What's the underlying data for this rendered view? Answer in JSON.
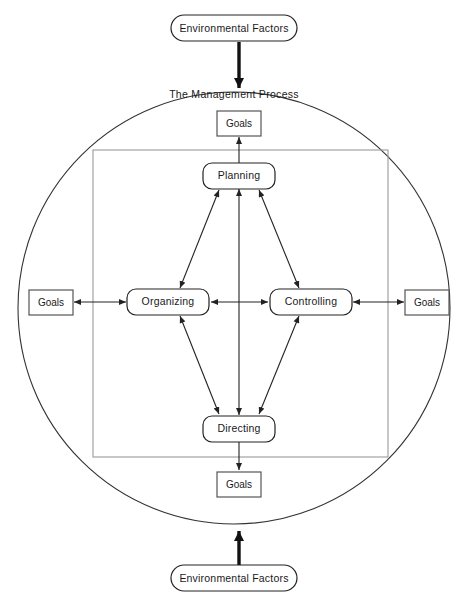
{
  "diagram": {
    "title": "The Management Process",
    "external_nodes": [
      {
        "id": "env-top",
        "label": "Environmental Factors",
        "shape": "rounded",
        "x": 234,
        "y": 28,
        "w": 126,
        "h": 26
      },
      {
        "id": "env-bottom",
        "label": "Environmental Factors",
        "shape": "rounded",
        "x": 234,
        "y": 578,
        "w": 126,
        "h": 26
      }
    ],
    "goal_nodes": [
      {
        "id": "goals-top",
        "label": "Goals",
        "shape": "rect",
        "x": 239,
        "y": 123,
        "w": 44,
        "h": 25
      },
      {
        "id": "goals-left",
        "label": "Goals",
        "shape": "rect",
        "x": 51,
        "y": 302,
        "w": 44,
        "h": 25
      },
      {
        "id": "goals-right",
        "label": "Goals",
        "shape": "rect",
        "x": 427,
        "y": 302,
        "w": 44,
        "h": 25
      },
      {
        "id": "goals-bottom",
        "label": "Goals",
        "shape": "rect",
        "x": 239,
        "y": 484,
        "w": 44,
        "h": 25
      }
    ],
    "process_nodes": [
      {
        "id": "planning",
        "label": "Planning",
        "shape": "rounded",
        "x": 239,
        "y": 175,
        "w": 72,
        "h": 25
      },
      {
        "id": "organizing",
        "label": "Organizing",
        "shape": "rounded",
        "x": 168,
        "y": 302,
        "w": 82,
        "h": 25
      },
      {
        "id": "controlling",
        "label": "Controlling",
        "shape": "rounded",
        "x": 311,
        "y": 302,
        "w": 82,
        "h": 25
      },
      {
        "id": "directing",
        "label": "Directing",
        "shape": "rounded",
        "x": 239,
        "y": 429,
        "w": 72,
        "h": 25
      }
    ],
    "boundary": {
      "circle": {
        "cx": 234,
        "cy": 308,
        "r": 216
      },
      "inner_rect": {
        "x": 93,
        "y": 150,
        "w": 295,
        "h": 307
      }
    },
    "connections": [
      {
        "id": "env-top-to-circle",
        "from": "env-top",
        "to": "management-process",
        "style": "thick-arrow",
        "direction": "down"
      },
      {
        "id": "env-bottom-to-circle",
        "from": "env-bottom",
        "to": "management-process",
        "style": "thick-arrow",
        "direction": "up"
      },
      {
        "id": "planning-to-goals-top",
        "from": "planning",
        "to": "goals-top",
        "style": "arrow",
        "direction": "up"
      },
      {
        "id": "directing-to-goals-bottom",
        "from": "directing",
        "to": "goals-bottom",
        "style": "arrow",
        "direction": "down"
      },
      {
        "id": "organizing-to-goals-left",
        "from": "organizing",
        "to": "goals-left",
        "style": "arrow",
        "direction": "bidirectional"
      },
      {
        "id": "controlling-to-goals-right",
        "from": "controlling",
        "to": "goals-right",
        "style": "arrow",
        "direction": "bidirectional"
      },
      {
        "id": "organizing-controlling",
        "from": "organizing",
        "to": "controlling",
        "style": "arrow",
        "direction": "bidirectional"
      },
      {
        "id": "planning-directing",
        "from": "planning",
        "to": "directing",
        "style": "arrow",
        "direction": "bidirectional"
      },
      {
        "id": "planning-organizing",
        "from": "planning",
        "to": "organizing",
        "style": "arrow",
        "direction": "bidirectional"
      },
      {
        "id": "planning-controlling",
        "from": "planning",
        "to": "controlling",
        "style": "arrow",
        "direction": "bidirectional"
      },
      {
        "id": "organizing-directing",
        "from": "organizing",
        "to": "directing",
        "style": "arrow",
        "direction": "bidirectional"
      },
      {
        "id": "controlling-directing",
        "from": "controlling",
        "to": "directing",
        "style": "arrow",
        "direction": "bidirectional"
      }
    ],
    "colors": {
      "background": "#ffffff",
      "stroke": "#222222",
      "inner_box_stroke": "#9a9a9a",
      "circle_stroke": "#333333",
      "text": "#1a1a1a"
    }
  }
}
